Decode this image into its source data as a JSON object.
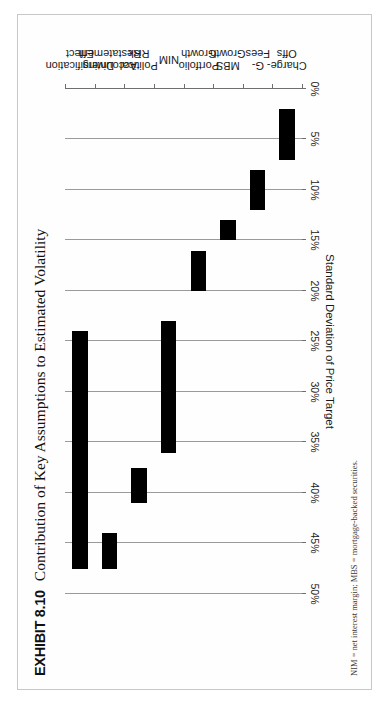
{
  "exhibit": {
    "label": "EXHIBIT 8.10",
    "title": "Contribution of Key Assumptions to Estimated Volatility",
    "footnote": "NIM = net interest margin; MBS = mortgage-backed securities."
  },
  "chart_data": {
    "type": "bar",
    "orientation": "floating-range-bars",
    "title": "Contribution of Key Assumptions to Estimated Volatility",
    "xlabel": "",
    "ylabel": "Standard Deviation of Price Target",
    "ylim": [
      0,
      50
    ],
    "ytick_labels": [
      "0%",
      "5%",
      "10%",
      "15%",
      "20%",
      "25%",
      "30%",
      "35%",
      "40%",
      "45%",
      "50%"
    ],
    "ytick_values": [
      0,
      5,
      10,
      15,
      20,
      25,
      30,
      35,
      40,
      45,
      50
    ],
    "grid": true,
    "grid_axis": "y",
    "legend": "none",
    "bar_color": "#000000",
    "categories": [
      "Charge-Offs",
      "G-Fees",
      "MBS Growth",
      "Portfolio Growth",
      "NIM",
      "Political Risk",
      "Accounting Restatement",
      "Diversification Effect"
    ],
    "series": [
      {
        "name": "Standard Deviation of Price Target range",
        "low": [
          2.0,
          8.0,
          13.0,
          16.0,
          23.0,
          37.5,
          44.0,
          24.0
        ],
        "high": [
          7.0,
          12.0,
          15.0,
          20.0,
          36.0,
          41.0,
          47.5,
          47.5
        ]
      }
    ]
  },
  "axis": {
    "value_axis_title": "Standard Deviation of Price Target"
  }
}
